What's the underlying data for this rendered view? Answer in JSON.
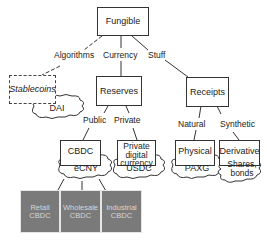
{
  "diagram": {
    "root": "Fungible",
    "edges": {
      "algorithms": "Algorithms",
      "currency": "Currency",
      "stuff": "Stuff",
      "public": "Public",
      "private": "Private",
      "natural": "Natural",
      "synthetic": "Synthetic"
    },
    "nodes": {
      "stablecoins": "Stablecoins",
      "reserves": "Reserves",
      "receipts": "Receipts",
      "cbdc": "CBDC",
      "private_digital_currency": "Private digital currency",
      "physical": "Physical",
      "derivative": "Derivative",
      "retail_cbdc": "Retail CBDC",
      "wholesale_cbdc": "Wholesale CBDC",
      "industrial_cbdc": "Industrial CBDC"
    },
    "examples": {
      "dai": "DAI",
      "ecny": "eCNY",
      "usdc": "USDC",
      "paxg": "PAXG",
      "shares_bonds": "Shares, bonds"
    }
  }
}
